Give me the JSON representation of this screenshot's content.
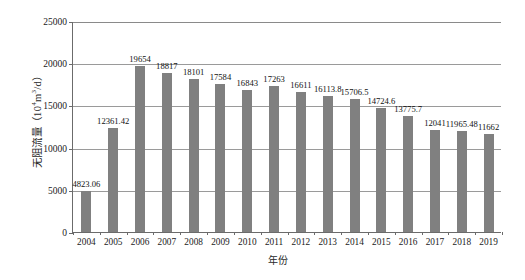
{
  "chart_data": {
    "type": "bar",
    "title": "",
    "xlabel": "年份",
    "ylabel": "无阻流量（10⁴m³/d）",
    "ylabel_main": "无阻流量（10",
    "ylabel_sup1": "4",
    "ylabel_mid": "m",
    "ylabel_sup2": "3",
    "ylabel_tail": "/d）",
    "categories": [
      "2004",
      "2005",
      "2006",
      "2007",
      "2008",
      "2009",
      "2010",
      "2011",
      "2012",
      "2013",
      "2014",
      "2015",
      "2016",
      "2017",
      "2018",
      "2019"
    ],
    "values": [
      4823.06,
      12361.42,
      19654,
      18817,
      18101,
      17584,
      16843,
      17263,
      16611,
      16113.8,
      15706.5,
      14724.6,
      13775.7,
      12041,
      11965.48,
      11662
    ],
    "value_labels": [
      "4823.06",
      "12361.42",
      "19654",
      "18817",
      "18101",
      "17584",
      "16843",
      "17263",
      "16611",
      "16113.8",
      "15706.5",
      "14724.6",
      "13775.7",
      "12041",
      "11965.48",
      "11662"
    ],
    "ylim": [
      0,
      25000
    ],
    "ytick_values": [
      0,
      5000,
      10000,
      15000,
      20000,
      25000
    ],
    "ytick_labels": [
      "0",
      "5000",
      "10000",
      "15000",
      "20000",
      "25000"
    ],
    "grid": true,
    "legend": false,
    "bar_color": "#808080",
    "axis_color": "#6b6b6b",
    "grid_color": "#9a9a9a",
    "background": "#ffffff"
  }
}
